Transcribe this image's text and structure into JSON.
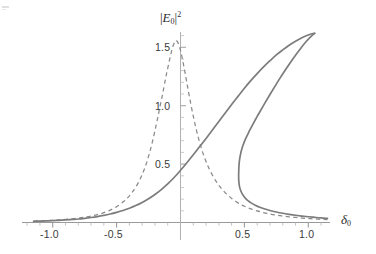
{
  "figure": {
    "background_color": "#ffffff",
    "curve_color": "#7c7c7c",
    "axis_color": "#9a9a9a",
    "text_color": "#3a3a3a",
    "width": 376,
    "height": 254
  },
  "chart_data": {
    "type": "line",
    "title": "",
    "subtitle": "",
    "xlabel": "δ₀",
    "ylabel": "|E₀|²",
    "xlim": [
      -1.18,
      1.18
    ],
    "ylim": [
      0.0,
      1.68
    ],
    "grid": false,
    "legend": null,
    "legend_position": "none",
    "x_ticks": [
      -1.0,
      -0.5,
      0.5,
      1.0
    ],
    "x_tick_labels": [
      "-1.0",
      "-0.5",
      "0.5",
      "1.0"
    ],
    "x_minor_tick_step": 0.1,
    "y_ticks": [
      0.5,
      1.0,
      1.5
    ],
    "y_tick_labels": [
      "0.5",
      "1.0",
      "1.5"
    ],
    "y_minor_tick_step": 0.1,
    "axis_origin": [
      0.0,
      0.0
    ],
    "series": [
      {
        "name": "dispersive-lorentzian-dashed",
        "style": "dashed",
        "color": "#8a8a8a",
        "peak_x": -0.035,
        "peak_y": 1.56,
        "points": [
          [
            -1.15,
            0.012
          ],
          [
            -1.1,
            0.014
          ],
          [
            -1.05,
            0.016
          ],
          [
            -1.0,
            0.019
          ],
          [
            -0.95,
            0.022
          ],
          [
            -0.9,
            0.026
          ],
          [
            -0.85,
            0.031
          ],
          [
            -0.8,
            0.037
          ],
          [
            -0.75,
            0.045
          ],
          [
            -0.7,
            0.055
          ],
          [
            -0.65,
            0.068
          ],
          [
            -0.6,
            0.084
          ],
          [
            -0.55,
            0.106
          ],
          [
            -0.5,
            0.135
          ],
          [
            -0.45,
            0.175
          ],
          [
            -0.42,
            0.205
          ],
          [
            -0.4,
            0.228
          ],
          [
            -0.38,
            0.255
          ],
          [
            -0.35,
            0.303
          ],
          [
            -0.32,
            0.362
          ],
          [
            -0.3,
            0.41
          ],
          [
            -0.28,
            0.465
          ],
          [
            -0.26,
            0.53
          ],
          [
            -0.24,
            0.605
          ],
          [
            -0.22,
            0.69
          ],
          [
            -0.2,
            0.785
          ],
          [
            -0.18,
            0.888
          ],
          [
            -0.16,
            0.995
          ],
          [
            -0.14,
            1.1
          ],
          [
            -0.12,
            1.215
          ],
          [
            -0.11,
            1.27
          ],
          [
            -0.1,
            1.32
          ],
          [
            -0.09,
            1.37
          ],
          [
            -0.08,
            1.42
          ],
          [
            -0.07,
            1.465
          ],
          [
            -0.06,
            1.505
          ],
          [
            -0.05,
            1.534
          ],
          [
            -0.04,
            1.552
          ],
          [
            -0.035,
            1.558
          ],
          [
            -0.03,
            1.556
          ],
          [
            -0.02,
            1.54
          ],
          [
            -0.01,
            1.512
          ],
          [
            0.0,
            1.472
          ],
          [
            0.01,
            1.425
          ],
          [
            0.02,
            1.372
          ],
          [
            0.03,
            1.315
          ],
          [
            0.04,
            1.255
          ],
          [
            0.05,
            1.195
          ],
          [
            0.06,
            1.135
          ],
          [
            0.08,
            1.018
          ],
          [
            0.1,
            0.91
          ],
          [
            0.12,
            0.812
          ],
          [
            0.14,
            0.725
          ],
          [
            0.16,
            0.648
          ],
          [
            0.18,
            0.58
          ],
          [
            0.2,
            0.522
          ],
          [
            0.22,
            0.47
          ],
          [
            0.25,
            0.405
          ],
          [
            0.28,
            0.35
          ],
          [
            0.3,
            0.318
          ],
          [
            0.33,
            0.278
          ],
          [
            0.36,
            0.244
          ],
          [
            0.4,
            0.206
          ],
          [
            0.45,
            0.168
          ],
          [
            0.5,
            0.139
          ],
          [
            0.55,
            0.117
          ],
          [
            0.6,
            0.099
          ],
          [
            0.65,
            0.085
          ],
          [
            0.7,
            0.073
          ],
          [
            0.75,
            0.063
          ],
          [
            0.8,
            0.055
          ],
          [
            0.85,
            0.048
          ],
          [
            0.9,
            0.043
          ],
          [
            0.95,
            0.038
          ],
          [
            1.0,
            0.034
          ],
          [
            1.05,
            0.03
          ],
          [
            1.1,
            0.027
          ],
          [
            1.15,
            0.024
          ]
        ]
      },
      {
        "name": "bistable-s-curve-solid",
        "style": "solid",
        "color": "#7c7c7c",
        "cusp_x": 1.05,
        "cusp_y": 1.62,
        "fold_turning_x": 0.455,
        "fold_turning_y": 0.335,
        "branches": [
          {
            "name": "lower-upper-branch",
            "points": [
              [
                -1.15,
                0.01
              ],
              [
                -1.1,
                0.012
              ],
              [
                -1.05,
                0.014
              ],
              [
                -1.0,
                0.016
              ],
              [
                -0.95,
                0.019
              ],
              [
                -0.9,
                0.022
              ],
              [
                -0.85,
                0.026
              ],
              [
                -0.8,
                0.03
              ],
              [
                -0.75,
                0.036
              ],
              [
                -0.7,
                0.043
              ],
              [
                -0.65,
                0.051
              ],
              [
                -0.6,
                0.061
              ],
              [
                -0.55,
                0.073
              ],
              [
                -0.5,
                0.087
              ],
              [
                -0.45,
                0.103
              ],
              [
                -0.4,
                0.122
              ],
              [
                -0.35,
                0.145
              ],
              [
                -0.3,
                0.172
              ],
              [
                -0.25,
                0.203
              ],
              [
                -0.2,
                0.24
              ],
              [
                -0.15,
                0.282
              ],
              [
                -0.1,
                0.33
              ],
              [
                -0.05,
                0.385
              ],
              [
                0.0,
                0.447
              ],
              [
                0.05,
                0.512
              ],
              [
                0.1,
                0.58
              ],
              [
                0.15,
                0.65
              ],
              [
                0.2,
                0.72
              ],
              [
                0.25,
                0.792
              ],
              [
                0.3,
                0.865
              ],
              [
                0.35,
                0.938
              ],
              [
                0.4,
                1.01
              ],
              [
                0.45,
                1.08
              ],
              [
                0.5,
                1.15
              ],
              [
                0.55,
                1.215
              ],
              [
                0.6,
                1.275
              ],
              [
                0.65,
                1.332
              ],
              [
                0.7,
                1.385
              ],
              [
                0.75,
                1.435
              ],
              [
                0.8,
                1.478
              ],
              [
                0.85,
                1.518
              ],
              [
                0.9,
                1.552
              ],
              [
                0.95,
                1.582
              ],
              [
                1.0,
                1.605
              ],
              [
                1.03,
                1.616
              ],
              [
                1.05,
                1.62
              ]
            ]
          },
          {
            "name": "middle-unstable-branch",
            "points": [
              [
                1.05,
                1.62
              ],
              [
                1.02,
                1.592
              ],
              [
                0.98,
                1.545
              ],
              [
                0.94,
                1.49
              ],
              [
                0.9,
                1.432
              ],
              [
                0.86,
                1.37
              ],
              [
                0.82,
                1.305
              ],
              [
                0.78,
                1.238
              ],
              [
                0.74,
                1.168
              ],
              [
                0.7,
                1.096
              ],
              [
                0.66,
                1.022
              ],
              [
                0.62,
                0.946
              ],
              [
                0.6,
                0.908
              ],
              [
                0.58,
                0.868
              ],
              [
                0.56,
                0.828
              ],
              [
                0.54,
                0.786
              ],
              [
                0.53,
                0.764
              ],
              [
                0.52,
                0.742
              ],
              [
                0.51,
                0.718
              ],
              [
                0.5,
                0.692
              ],
              [
                0.49,
                0.664
              ],
              [
                0.485,
                0.648
              ],
              [
                0.48,
                0.63
              ],
              [
                0.475,
                0.61
              ],
              [
                0.47,
                0.586
              ],
              [
                0.465,
                0.558
              ],
              [
                0.462,
                0.535
              ],
              [
                0.459,
                0.505
              ],
              [
                0.457,
                0.475
              ],
              [
                0.456,
                0.445
              ],
              [
                0.455,
                0.412
              ],
              [
                0.4552,
                0.382
              ],
              [
                0.4562,
                0.358
              ],
              [
                0.458,
                0.335
              ],
              [
                0.461,
                0.312
              ],
              [
                0.466,
                0.29
              ],
              [
                0.473,
                0.268
              ],
              [
                0.482,
                0.247
              ],
              [
                0.494,
                0.226
              ],
              [
                0.51,
                0.205
              ],
              [
                0.53,
                0.185
              ],
              [
                0.555,
                0.166
              ],
              [
                0.585,
                0.148
              ],
              [
                0.62,
                0.131
              ],
              [
                0.66,
                0.116
              ],
              [
                0.7,
                0.103
              ],
              [
                0.75,
                0.09
              ],
              [
                0.8,
                0.079
              ],
              [
                0.85,
                0.07
              ],
              [
                0.9,
                0.062
              ],
              [
                0.95,
                0.055
              ],
              [
                1.0,
                0.049
              ],
              [
                1.05,
                0.044
              ],
              [
                1.1,
                0.039
              ],
              [
                1.15,
                0.035
              ]
            ]
          }
        ]
      }
    ]
  },
  "labels": {
    "y_axis_title_parts": {
      "bar_open": "|",
      "symbol": "E",
      "subscript": "0",
      "bar_close": "|",
      "superscript": "2"
    },
    "x_axis_title_parts": {
      "symbol": "δ",
      "subscript": "0"
    }
  }
}
